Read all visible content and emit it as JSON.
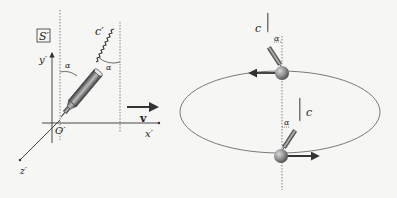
{
  "figure": {
    "left_panel": {
      "frame_label": "S′",
      "axes": {
        "x": "x′",
        "y": "y′",
        "z": "z′",
        "origin": "O′"
      },
      "light_label": "c′",
      "angle_label_1": "α",
      "angle_label_2": "α",
      "velocity_label": "v"
    },
    "right_panel": {
      "top_light_label": "c",
      "top_angle_label": "α",
      "bottom_light_label": "c",
      "bottom_angle_label": "α"
    },
    "colors": {
      "line": "#333333",
      "dotted": "#666666",
      "ellipse": "#7a7a7a",
      "ball": "#8a8a8a",
      "telescope": "#555555",
      "background": "#f6f6f4"
    }
  }
}
